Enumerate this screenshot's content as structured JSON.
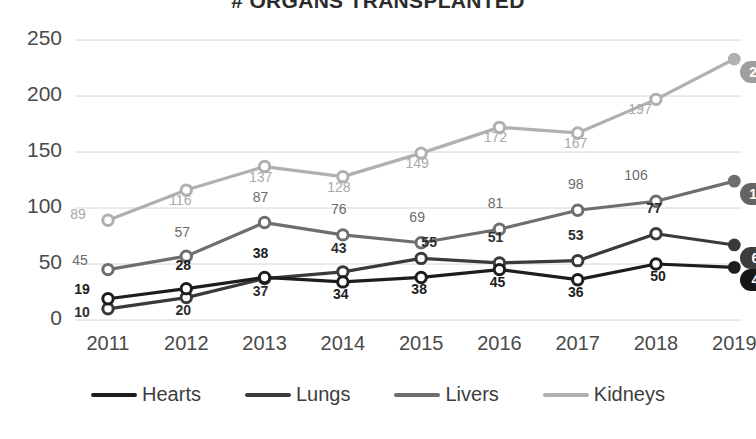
{
  "chart_data": {
    "type": "line",
    "title": "# ORGANS TRANSPLANTED",
    "xlabel": "",
    "ylabel": "",
    "categories": [
      "2011",
      "2012",
      "2013",
      "2014",
      "2015",
      "2016",
      "2017",
      "2018",
      "2019"
    ],
    "ylim": [
      0,
      250
    ],
    "yticks": [
      "0",
      "50",
      "100",
      "150",
      "200",
      "250"
    ],
    "grid": true,
    "legend_position": "bottom",
    "series": [
      {
        "name": "Hearts",
        "color": "#1d1d1d",
        "badge_color": "#161616",
        "values": [
          19,
          28,
          38,
          34,
          38,
          45,
          36,
          50,
          47
        ],
        "labels": [
          "19",
          "28",
          "38",
          "34",
          "38",
          "45",
          "36",
          "50",
          "47"
        ]
      },
      {
        "name": "Lungs",
        "color": "#3a3a3a",
        "badge_color": "#3d3d3d",
        "values": [
          10,
          20,
          37,
          43,
          55,
          51,
          53,
          77,
          67
        ],
        "labels": [
          "10",
          "20",
          "37",
          "43",
          "55",
          "51",
          "53",
          "77",
          "67"
        ]
      },
      {
        "name": "Livers",
        "color": "#6e6e6e",
        "badge_color": "#646464",
        "values": [
          45,
          57,
          87,
          76,
          69,
          81,
          98,
          106,
          124
        ],
        "labels": [
          "45",
          "57",
          "87",
          "76",
          "69",
          "81",
          "98",
          "106",
          "124"
        ]
      },
      {
        "name": "Kidneys",
        "color": "#b0b0b0",
        "badge_color": "#9e9e9e",
        "values": [
          89,
          116,
          137,
          128,
          149,
          172,
          167,
          197,
          233
        ],
        "labels": [
          "89",
          "116",
          "137",
          "128",
          "149",
          "172",
          "167",
          "197",
          "233"
        ]
      }
    ],
    "end_badges": [
      {
        "series": "Kidneys",
        "value": "233"
      },
      {
        "series": "Livers",
        "value": "124"
      },
      {
        "series": "Lungs",
        "value": "67"
      },
      {
        "series": "Hearts",
        "value": "47"
      }
    ]
  },
  "legend": {
    "items": [
      {
        "label": "Hearts"
      },
      {
        "label": "Lungs"
      },
      {
        "label": "Livers"
      },
      {
        "label": "Kidneys"
      }
    ]
  }
}
